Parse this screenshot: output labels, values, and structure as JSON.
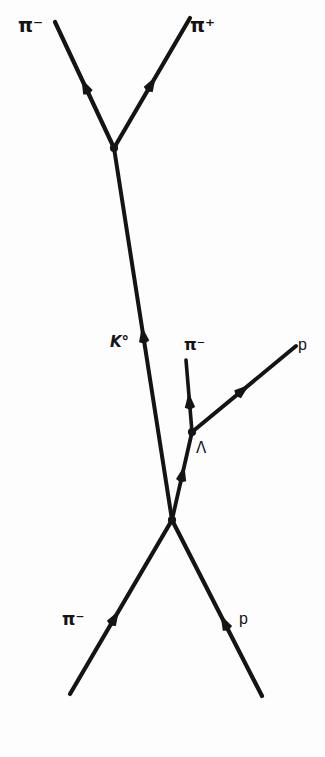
{
  "diagram": {
    "type": "particle-interaction-diagram",
    "background_color": "#fdfdfd",
    "line_color": "#141414",
    "labels": {
      "pi_minus_top": "π⁻",
      "pi_plus_top": "π⁺",
      "k_zero": "K°",
      "pi_minus_middle": "π⁻",
      "p_right": "p",
      "lambda": "Λ",
      "pi_minus_bottom": "π⁻",
      "p_bottom": "p"
    },
    "vertices": {
      "kaon_decay": {
        "x": 114,
        "y": 148,
        "name": "K-zero-decay-vertex"
      },
      "lambda_decay": {
        "x": 192,
        "y": 432,
        "name": "lambda-decay-vertex"
      },
      "primary_interaction": {
        "x": 172,
        "y": 520,
        "name": "primary-interaction-vertex"
      }
    },
    "tracks": [
      {
        "name": "pi-minus-from-kaon",
        "from": [
          114,
          148
        ],
        "to": [
          55,
          22
        ],
        "arrow_at": 0.55,
        "width": 4.2
      },
      {
        "name": "pi-plus-from-kaon",
        "from": [
          114,
          148
        ],
        "to": [
          190,
          18
        ],
        "arrow_at": 0.55,
        "width": 4.2
      },
      {
        "name": "k-zero-track",
        "from": [
          172,
          520
        ],
        "to": [
          114,
          148
        ],
        "arrow_at": 0.52,
        "width": 4.0
      },
      {
        "name": "pi-minus-from-lambda",
        "from": [
          192,
          432
        ],
        "to": [
          186,
          360
        ],
        "arrow_at": 0.55,
        "width": 3.6
      },
      {
        "name": "proton-from-lambda",
        "from": [
          192,
          432
        ],
        "to": [
          296,
          346
        ],
        "arrow_at": 0.55,
        "width": 4.0
      },
      {
        "name": "lambda-track",
        "from": [
          172,
          520
        ],
        "to": [
          192,
          432
        ],
        "arrow_at": 0.62,
        "width": 3.8
      },
      {
        "name": "pi-minus-beam",
        "from": [
          70,
          694
        ],
        "to": [
          172,
          520
        ],
        "arrow_at": 0.48,
        "width": 4.2
      },
      {
        "name": "proton-target-track",
        "from": [
          262,
          696
        ],
        "to": [
          172,
          520
        ],
        "arrow_at": 0.46,
        "width": 4.2
      }
    ]
  }
}
